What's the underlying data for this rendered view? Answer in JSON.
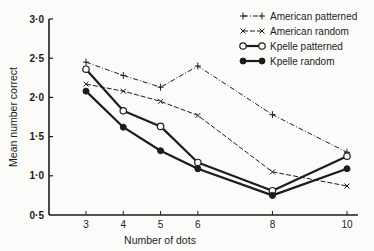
{
  "chart_data": {
    "type": "line",
    "title": "",
    "xlabel": "Number of dots",
    "ylabel": "Mean number correct",
    "x": [
      3,
      4,
      5,
      6,
      8,
      10
    ],
    "xticks": [
      "3",
      "4",
      "5",
      "6",
      "8",
      "10"
    ],
    "yticks": [
      "0·5",
      "1·0",
      "1·5",
      "2·0",
      "2·5",
      "3·0"
    ],
    "ylim": [
      0.5,
      3.0
    ],
    "xlim": [
      2,
      10.4
    ],
    "grid": false,
    "legend_position": "upper right",
    "series": [
      {
        "name": "American patterned",
        "marker": "plus",
        "line": "dash-dot",
        "values": [
          2.45,
          2.28,
          2.13,
          2.4,
          1.78,
          1.3
        ]
      },
      {
        "name": "American random",
        "marker": "x",
        "line": "dashed",
        "values": [
          2.17,
          2.08,
          1.95,
          1.77,
          1.05,
          0.87
        ]
      },
      {
        "name": "Kpelle patterned",
        "marker": "open-circle",
        "line": "solid-thick",
        "values": [
          2.36,
          1.83,
          1.63,
          1.17,
          0.81,
          1.25
        ]
      },
      {
        "name": "Kpelle random",
        "marker": "filled-circle",
        "line": "solid-thick",
        "values": [
          2.08,
          1.62,
          1.32,
          1.09,
          0.75,
          1.09
        ]
      }
    ]
  },
  "colors": {
    "ink": "#1c1c1c",
    "background": "#fbfbf9"
  }
}
